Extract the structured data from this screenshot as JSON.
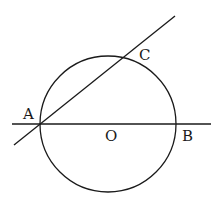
{
  "diagram": {
    "type": "geometry",
    "circle": {
      "center": "O",
      "cx": 108,
      "cy": 124,
      "r": 68
    },
    "lines": [
      {
        "name": "diameter-AB",
        "x1": 12,
        "y1": 124,
        "x2": 211,
        "y2": 124
      },
      {
        "name": "secant-AC",
        "x1": 14,
        "y1": 145,
        "x2": 175,
        "y2": 16
      }
    ],
    "points": [
      {
        "label": "A",
        "x": 40,
        "y": 124,
        "lx": 23,
        "ly": 119
      },
      {
        "label": "O",
        "x": 108,
        "y": 124,
        "lx": 105,
        "ly": 141
      },
      {
        "label": "B",
        "x": 176,
        "y": 124,
        "lx": 182,
        "ly": 141
      },
      {
        "label": "C",
        "x": 125,
        "y": 57,
        "lx": 139,
        "ly": 60
      }
    ],
    "labels": {
      "A": "A",
      "O": "O",
      "B": "B",
      "C": "C"
    }
  }
}
